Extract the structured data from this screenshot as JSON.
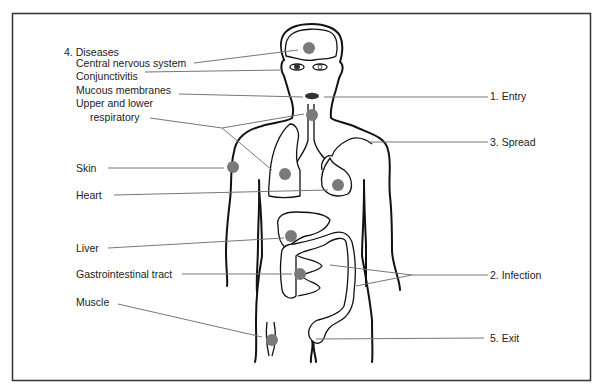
{
  "diagram": {
    "colors": {
      "dot": "#7a7a7a",
      "leader": "#777777",
      "outline": "#111111",
      "frame": "#333333"
    },
    "left_labels": {
      "heading": "4. Diseases",
      "cns": "Central nervous system",
      "conjunctivitis": "Conjunctivitis",
      "mucous": "Mucous membranes",
      "resp1": "Upper and lower",
      "resp2": "respiratory",
      "skin": "Skin",
      "heart": "Heart",
      "liver": "Liver",
      "gi": "Gastrointestinal tract",
      "muscle": "Muscle"
    },
    "right_labels": {
      "entry": "1. Entry",
      "spread": "3. Spread",
      "infection": "2. Infection",
      "exit": "5. Exit"
    }
  }
}
